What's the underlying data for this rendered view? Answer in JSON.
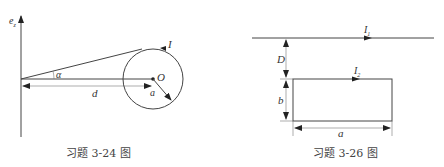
{
  "figures": [
    {
      "id": "fig-3-24",
      "caption": "习题 3-24 图",
      "labels": {
        "axis": "e",
        "axis_sub": "z",
        "angle": "α",
        "distance": "d",
        "center": "O",
        "radius": "a",
        "current": "I"
      }
    },
    {
      "id": "fig-3-26",
      "caption": "习题 3-26 图",
      "labels": {
        "wire_current": "I",
        "wire_current_sub": "1",
        "loop_current": "I",
        "loop_current_sub": "2",
        "gap": "D",
        "height": "b",
        "width": "a"
      }
    }
  ]
}
